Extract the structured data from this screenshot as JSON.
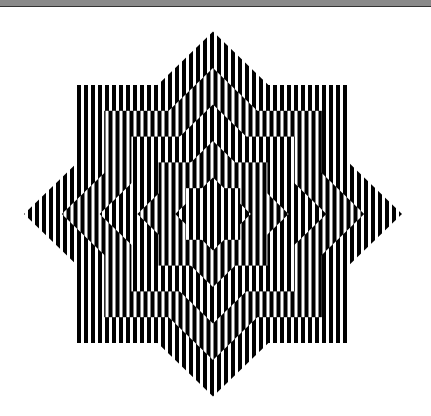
{
  "figure": {
    "shape": "eight-pointed-star",
    "center": [
      213,
      214
    ],
    "outer_square": {
      "x": 77,
      "y": 84,
      "w": 272,
      "h": 258
    },
    "outer_diamond_points": {
      "top": [
        213,
        32
      ],
      "right": [
        400,
        213
      ],
      "bottom": [
        212,
        397
      ],
      "left": [
        22,
        213
      ]
    },
    "nested_levels": 5,
    "stripe_period_px": 7,
    "colors": {
      "stripe_dark": "#000000",
      "stripe_light": "#ffffff",
      "background": "#ffffff",
      "top_bar": "#8a8a8a"
    }
  }
}
